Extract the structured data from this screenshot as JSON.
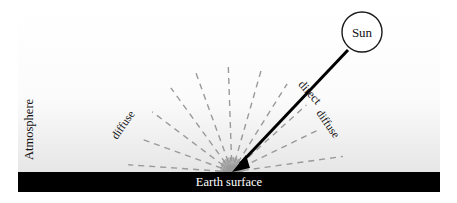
{
  "diagram": {
    "title_labels": {
      "sun": "Sun",
      "earth_surface": "Earth surface",
      "atmosphere": "Atmosphere",
      "direct": "direct",
      "diffuse_left": "diffuse",
      "diffuse_right": "diffuse"
    },
    "colors": {
      "background_top": "#ffffff",
      "background_bottom": "#e9e9e9",
      "surface_bar": "#000000",
      "surface_text": "#ffffff",
      "ray_dashed": "#9a9a9a",
      "arrow": "#000000",
      "sun_outline": "#1a1a1a",
      "sun_fill": "#ffffff",
      "text": "#111111"
    },
    "geometry": {
      "convergence_point": {
        "x": 232,
        "y": 172
      },
      "sun_circle": {
        "cx": 362,
        "cy": 32,
        "r": 20
      },
      "surface_bar": {
        "x": 18,
        "y": 172,
        "width": 422,
        "height": 20
      },
      "atmosphere_band": {
        "x": 18,
        "y": 10,
        "width": 422,
        "height": 162
      }
    },
    "diffuse_rays": {
      "count": 11,
      "description": "gray dashed rays radiating upward from the convergence point",
      "angles_deg": [
        176,
        160,
        143,
        126,
        110,
        92,
        74,
        58,
        42,
        26,
        8
      ],
      "lengths": [
        104,
        96,
        100,
        104,
        108,
        110,
        108,
        104,
        100,
        96,
        112
      ]
    },
    "burst_rays": {
      "count": 27,
      "description": "dense short gray rays at the convergence point",
      "length": 15
    },
    "direct_beam": {
      "from": {
        "x": 348,
        "y": 50
      },
      "to": {
        "x": 232,
        "y": 172
      },
      "arrowhead": "solid-triangle",
      "stroke_width": 3
    }
  }
}
